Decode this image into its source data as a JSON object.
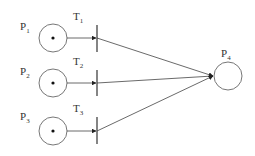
{
  "diagram": {
    "type": "petri-net",
    "places": [
      {
        "id": "P1",
        "label": "P",
        "sub": "1",
        "tokens": 1
      },
      {
        "id": "P2",
        "label": "P",
        "sub": "2",
        "tokens": 1
      },
      {
        "id": "P3",
        "label": "P",
        "sub": "3",
        "tokens": 1
      },
      {
        "id": "P4",
        "label": "P",
        "sub": "4",
        "tokens": 0
      }
    ],
    "transitions": [
      {
        "id": "T1",
        "label": "T",
        "sub": "1"
      },
      {
        "id": "T2",
        "label": "T",
        "sub": "2"
      },
      {
        "id": "T3",
        "label": "T",
        "sub": "3"
      }
    ],
    "arcs": [
      {
        "from": "P1",
        "to": "T1"
      },
      {
        "from": "P2",
        "to": "T2"
      },
      {
        "from": "P3",
        "to": "T3"
      },
      {
        "from": "T1",
        "to": "P4"
      },
      {
        "from": "T2",
        "to": "P4"
      },
      {
        "from": "T3",
        "to": "P4"
      }
    ],
    "colors": {
      "stroke": "#555555",
      "arc": "#333333",
      "token": "#111111"
    }
  }
}
